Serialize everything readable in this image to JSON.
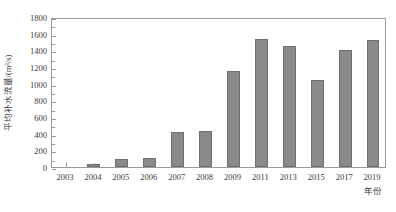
{
  "chart_data": {
    "type": "bar",
    "title": "",
    "xlabel": "年份",
    "ylabel": "平均补水流量/(m³/s)",
    "categories": [
      "2003",
      "2004",
      "2005",
      "2006",
      "2007",
      "2008",
      "2009",
      "2011",
      "2013",
      "2015",
      "2017",
      "2019"
    ],
    "values": [
      0,
      40,
      100,
      110,
      420,
      430,
      1150,
      1540,
      1450,
      1050,
      1400,
      1520
    ],
    "series": [
      {
        "name": "平均补水流量",
        "values": [
          0,
          40,
          100,
          110,
          420,
          430,
          1150,
          1540,
          1450,
          1050,
          1400,
          1520
        ]
      }
    ],
    "ylim": [
      0,
      1800
    ],
    "ytick_labels": [
      "0",
      "200",
      "400",
      "600",
      "800",
      "1000",
      "1200",
      "1400",
      "1600",
      "1800"
    ],
    "ytick_values": [
      0,
      200,
      400,
      600,
      800,
      1000,
      1200,
      1400,
      1600,
      1800
    ],
    "grid": false,
    "legend": false,
    "legend_position": "none",
    "bar_color": "#8a8a8a",
    "axis_color": "#9a9a9a",
    "text_color": "#3b3b3b",
    "background_color": "#ffffff"
  }
}
